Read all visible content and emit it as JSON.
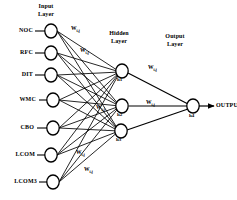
{
  "diagram": {
    "title_input": "Input\nLayer",
    "title_hidden": "Hidden\nLayer",
    "title_output": "Output\nLayer",
    "output_text": "OUTPUT",
    "stroke_color": "#000000",
    "node_fill": "#ffffff"
  },
  "input_layer": {
    "nodes": [
      {
        "label": "NOC",
        "id": "i1"
      },
      {
        "label": "RFC",
        "id": "i2"
      },
      {
        "label": "DIT",
        "id": "i3"
      },
      {
        "label": "WMC",
        "id": "i4"
      },
      {
        "label": "CBO",
        "id": "i5"
      },
      {
        "label": "LCOM",
        "id": "i6"
      },
      {
        "label": "LCOM3",
        "id": "i7"
      }
    ]
  },
  "hidden_layer": {
    "nodes": [
      {
        "label": "h1"
      },
      {
        "label": "h2"
      },
      {
        "label": "h3"
      }
    ]
  },
  "output_layer": {
    "nodes": [
      {
        "label": "h4"
      }
    ]
  },
  "weights": [
    {
      "sym": "W",
      "sub": "i,j"
    },
    {
      "sym": "W",
      "sub": "i,j"
    },
    {
      "sym": "W",
      "sub": "i,j"
    },
    {
      "sym": "W",
      "sub": "i,j"
    },
    {
      "sym": "W",
      "sub": "i,j"
    },
    {
      "sym": "W",
      "sub": "i,j"
    },
    {
      "sym": "W",
      "sub": "i,j"
    }
  ]
}
